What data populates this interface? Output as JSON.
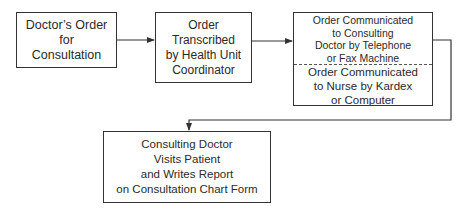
{
  "diagram": {
    "type": "flowchart",
    "nodes": [
      {
        "id": "doctors-order",
        "lines": [
          "Doctor’s Order",
          "for",
          "Consultation"
        ]
      },
      {
        "id": "order-transcribed",
        "lines": [
          "Order",
          "Transcribed",
          "by Health Unit",
          "Coordinator"
        ]
      },
      {
        "id": "order-communicated",
        "top_lines": [
          "Order Communicated",
          "to Consulting",
          "Doctor by Telephone",
          "or Fax Machine"
        ],
        "bottom_lines": [
          "Order Communicated",
          "to Nurse by Kardex",
          "or Computer"
        ]
      },
      {
        "id": "consulting-doctor-visits",
        "lines": [
          "Consulting Doctor",
          "Visits Patient",
          "and Writes Report",
          "on Consultation Chart Form"
        ]
      }
    ],
    "edges": [
      {
        "from": "doctors-order",
        "to": "order-transcribed"
      },
      {
        "from": "order-transcribed",
        "to": "order-communicated"
      },
      {
        "from": "order-communicated",
        "to": "consulting-doctor-visits"
      }
    ],
    "colors": {
      "line": "#333333",
      "text": "#2a2a2a",
      "background": "#ffffff"
    }
  }
}
